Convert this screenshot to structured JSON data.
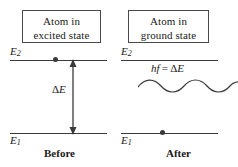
{
  "figure": {
    "stroke_color": "#3a3a3a",
    "text_color": "#1a1a1a",
    "background_color": "#ffffff"
  },
  "panels": {
    "before": {
      "caption": "Before",
      "box": {
        "line1": "Atom in",
        "line2": "excited state"
      },
      "levels": {
        "upper_label_symbol": "E",
        "upper_label_sub": "2",
        "lower_label_symbol": "E",
        "lower_label_sub": "1"
      },
      "electron_position": "upper-level",
      "transition_label_delta": "Δ",
      "transition_label_symbol": "E"
    },
    "after": {
      "caption": "After",
      "box": {
        "line1": "Atom in",
        "line2": "ground state"
      },
      "levels": {
        "upper_label_symbol": "E",
        "upper_label_sub": "2",
        "lower_label_symbol": "E",
        "lower_label_sub": "1"
      },
      "electron_position": "lower-level",
      "photon_label_h": "h",
      "photon_label_f": "f",
      "photon_label_eq": " = ",
      "photon_label_delta": "Δ",
      "photon_label_energy": "E"
    }
  }
}
